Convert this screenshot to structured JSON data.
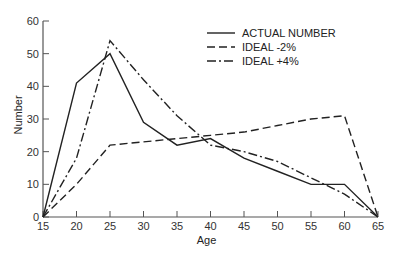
{
  "chart_data": {
    "type": "line",
    "title": "",
    "xlabel": "Age",
    "ylabel": "Number",
    "x": [
      15,
      20,
      25,
      30,
      35,
      40,
      45,
      50,
      55,
      60,
      65
    ],
    "xticks": [
      "15",
      "20",
      "25",
      "30",
      "35",
      "40",
      "45",
      "50",
      "55",
      "60",
      "65"
    ],
    "yticks": [
      "0",
      "10",
      "20",
      "30",
      "40",
      "50",
      "60"
    ],
    "xlim": [
      15,
      65
    ],
    "ylim": [
      0,
      60
    ],
    "grid": false,
    "legend_position": "upper right",
    "series": [
      {
        "name": "ACTUAL NUMBER",
        "style": "solid",
        "values": [
          0,
          41,
          50,
          29,
          22,
          24,
          18,
          14,
          10,
          10,
          0
        ]
      },
      {
        "name": "IDEAL -2%",
        "style": "dashed",
        "values": [
          0,
          10,
          22,
          23,
          24,
          25,
          26,
          28,
          30,
          31,
          0
        ]
      },
      {
        "name": "IDEAL +4%",
        "style": "dash-dot",
        "values": [
          0,
          18,
          54,
          42,
          31,
          22,
          20,
          17,
          12,
          7,
          0
        ]
      }
    ]
  },
  "colors": {
    "line": "#222222",
    "axis": "#555555"
  }
}
